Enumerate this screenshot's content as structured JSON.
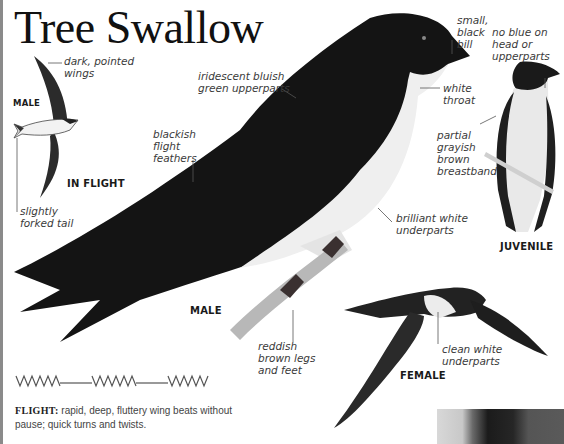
{
  "title": "Tree Swallow",
  "labels": {
    "male_flight_tag": "MALE",
    "in_flight": "IN FLIGHT",
    "male": "MALE",
    "juvenile": "JUVENILE",
    "female": "FEMALE"
  },
  "annotations": {
    "dark_pointed_wings": "dark, pointed\nwings",
    "slightly_forked_tail": "slightly\nforked tail",
    "iridescent_upperparts": "iridescent bluish\ngreen upperparts",
    "blackish_flight_feathers": "blackish\nflight\nfeathers",
    "small_black_bill": "small,\nblack\nbill",
    "white_throat": "white\nthroat",
    "brilliant_white_underparts": "brilliant white\nunderparts",
    "reddish_legs": "reddish\nbrown legs\nand feet",
    "no_blue": "no blue on\nhead or\nupperparts",
    "partial_breastband": "partial\ngrayish\nbrown\nbreastband",
    "clean_white_underparts": "clean white\nunderparts"
  },
  "flight": {
    "keyword": "FLIGHT:",
    "description": " rapid, deep, fluttery wing beats without pause; quick turns and twists.",
    "pattern_icon": "zigzag-flight-pattern"
  },
  "colors": {
    "title": "#111111",
    "annotation_text": "#3a3a3a",
    "leader_line": "#555555",
    "bird_dark": "#141414",
    "bird_white": "#f0f0f0"
  }
}
